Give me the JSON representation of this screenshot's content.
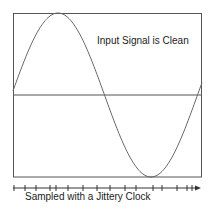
{
  "diagram": {
    "annotation": "Input Signal is Clean",
    "axis_label": "Sampled with a Jittery Clock",
    "colors": {
      "frame": "#555555",
      "signal": "#666666",
      "axis": "#333333",
      "background": "#ffffff"
    },
    "frame": {
      "left": 13,
      "top": 13,
      "right": 202,
      "bottom": 177,
      "midline_y": 95
    },
    "signal": {
      "type": "sine",
      "cycles": 1,
      "start_phase_note": "starts slightly above midline, peaks near x=58, troughs near x=151"
    },
    "time_axis": {
      "y": 188,
      "x_start": 13,
      "x_end": 201,
      "arrow": true,
      "tick_x": [
        14,
        25,
        36,
        50,
        56,
        68,
        83,
        97,
        110,
        125,
        136,
        153,
        162,
        177,
        187,
        192
      ]
    }
  }
}
